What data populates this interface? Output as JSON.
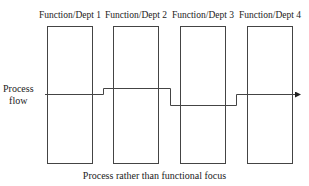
{
  "diagram": {
    "departments": [
      {
        "label": "Function/Dept 1"
      },
      {
        "label": "Function/Dept 2"
      },
      {
        "label": "Function/Dept 3"
      },
      {
        "label": "Function/Dept 4"
      }
    ],
    "flow_label_line1": "Process",
    "flow_label_line2": "flow",
    "caption": "Process rather than functional focus",
    "colors": {
      "stroke": "#333333",
      "background": "#ffffff"
    }
  }
}
